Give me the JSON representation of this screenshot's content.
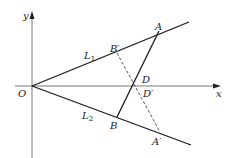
{
  "diagram": {
    "axes": {
      "x_label": "x",
      "y_label": "y",
      "origin_label": "O"
    },
    "lines": [
      {
        "name": "L",
        "subscript": "1"
      },
      {
        "name": "L",
        "subscript": "2"
      }
    ],
    "points": {
      "A": "A",
      "B_prime": "B′",
      "B": "B",
      "A_prime": "A′",
      "D": "D",
      "D_prime": "D′"
    },
    "colors": {
      "stroke": "#1a1a1a",
      "axis": "#555555",
      "dashed": "#444444"
    }
  }
}
